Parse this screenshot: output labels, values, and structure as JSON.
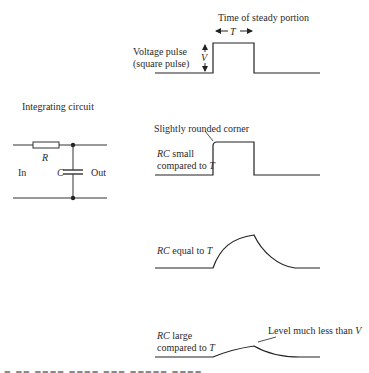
{
  "diagram": {
    "type": "rc-integrating-circuit-response",
    "circuit": {
      "title": "Integrating circuit",
      "components": {
        "resistor": "R",
        "capacitor": "C"
      },
      "input_label": "In",
      "output_label": "Out"
    },
    "waveforms": [
      {
        "id": "input",
        "label_line1": "Voltage pulse",
        "label_line2": "(square pulse)",
        "amplitude_label": "V",
        "width_label": "T",
        "width_caption": "Time of steady portion",
        "shape": "square"
      },
      {
        "id": "rc-small",
        "label_rc": "RC",
        "label_line1_rest": " small",
        "label_line2": "compared to ",
        "label_line2_var": "T",
        "annotation": "Slightly rounded corner",
        "shape": "near-square"
      },
      {
        "id": "rc-equal",
        "label_rc": "RC",
        "label_rest": " equal to ",
        "label_var": "T",
        "shape": "exponential-rise-fall"
      },
      {
        "id": "rc-large",
        "label_rc": "RC",
        "label_line1_rest": " large",
        "label_line2": "compared to ",
        "label_line2_var": "T",
        "annotation": "Level much less than ",
        "annotation_var": "V",
        "shape": "small-ramp"
      }
    ]
  }
}
